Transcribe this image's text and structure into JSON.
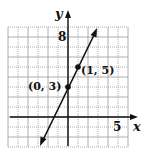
{
  "chart_data": {
    "type": "line",
    "title": "",
    "xlabel": "x",
    "ylabel": "y",
    "xlim": [
      -6,
      6
    ],
    "ylim": [
      -3,
      9
    ],
    "grid": true,
    "tick_labels": {
      "x": [
        "5"
      ],
      "y": [
        "8"
      ]
    },
    "series": [
      {
        "name": "y = 2x + 3",
        "x": [
          -3,
          0,
          1,
          3
        ],
        "y": [
          -3,
          3,
          5,
          9
        ],
        "arrows_both_ends": true
      }
    ],
    "points": [
      {
        "x": 0,
        "y": 3,
        "label": "(0, 3)"
      },
      {
        "x": 1,
        "y": 5,
        "label": "(1, 5)"
      }
    ]
  },
  "labels": {
    "x_axis": "x",
    "y_axis": "y",
    "x_tick": "5",
    "y_tick": "8",
    "point_a": "(0, 3)",
    "point_b": "(1, 5)"
  },
  "colors": {
    "grid": "#9a9a9a",
    "axis": "#111111",
    "line": "#111111"
  }
}
